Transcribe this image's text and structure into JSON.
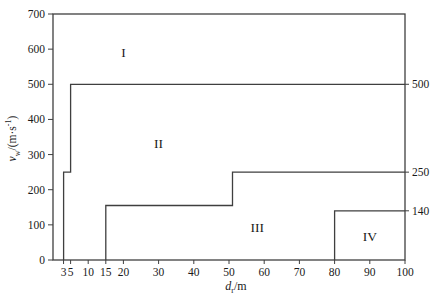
{
  "chart_data": {
    "type": "line",
    "title": "",
    "xlabel": "dr/m",
    "ylabel": "vw/(m·s-1)",
    "xlim": [
      0,
      100
    ],
    "ylim": [
      0,
      700
    ],
    "grid": false,
    "x_ticks": [
      3,
      5,
      10,
      15,
      20,
      30,
      40,
      50,
      60,
      70,
      80,
      90,
      100
    ],
    "y_ticks": [
      0,
      100,
      200,
      300,
      400,
      500,
      600,
      700
    ],
    "x_label": {
      "symbol": "d",
      "subscript": "r",
      "unit": "/m"
    },
    "y_label": {
      "symbol": "v",
      "subscript": "w",
      "unit": "/(m·s",
      "sup": "-1",
      "close": ")"
    },
    "right_axis_labels": [
      {
        "label": "500",
        "value": 500
      },
      {
        "label": "250",
        "value": 250
      },
      {
        "label": "140",
        "value": 140
      }
    ],
    "series": [
      {
        "name": "boundary-region-I-II",
        "points": [
          [
            3,
            0
          ],
          [
            3,
            250
          ],
          [
            5,
            250
          ],
          [
            5,
            500
          ],
          [
            100,
            500
          ]
        ]
      },
      {
        "name": "boundary-region-II-III",
        "points": [
          [
            15,
            0
          ],
          [
            15,
            155
          ],
          [
            51,
            155
          ],
          [
            51,
            250
          ],
          [
            100,
            250
          ]
        ]
      },
      {
        "name": "boundary-region-III-IV",
        "points": [
          [
            80,
            0
          ],
          [
            80,
            140
          ],
          [
            100,
            140
          ]
        ]
      }
    ],
    "region_labels": [
      {
        "label": "I",
        "x": 20,
        "y": 590
      },
      {
        "label": "II",
        "x": 30,
        "y": 330
      },
      {
        "label": "III",
        "x": 58,
        "y": 92
      },
      {
        "label": "IV",
        "x": 90,
        "y": 66
      }
    ],
    "colors": {
      "line": "#3f3f3f",
      "axis": "#3f3f3f",
      "text": "#1a1a1a",
      "background": "#ffffff"
    }
  }
}
